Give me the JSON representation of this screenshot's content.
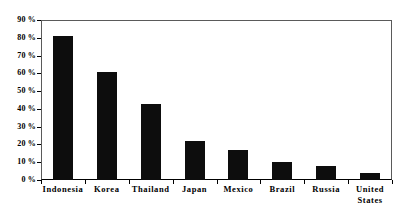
{
  "chart_data": {
    "type": "bar",
    "title": "",
    "subtitle": "",
    "xlabel": "",
    "ylabel": "",
    "categories": [
      "Indonesia",
      "Korea",
      "Thailand",
      "Japan",
      "Mexico",
      "Brazil",
      "Russia",
      "United\nStates"
    ],
    "values": [
      81,
      61,
      43,
      22,
      17,
      10,
      8,
      4
    ],
    "ylim": [
      0,
      90
    ],
    "ytick_values": [
      0,
      10,
      20,
      30,
      40,
      50,
      60,
      70,
      80,
      90
    ],
    "ytick_labels": [
      "0 %",
      "10 %",
      "20 %",
      "30 %",
      "40 %",
      "50 %",
      "60 %",
      "70 %",
      "80 %",
      "90 %"
    ],
    "grid": false,
    "legend": null,
    "legend_position": "none",
    "bar_color": "#0d0d0d",
    "frame_color": "#5a5a5a",
    "axis_color": "#000000",
    "background_color": "#ffffff",
    "annotations": []
  }
}
